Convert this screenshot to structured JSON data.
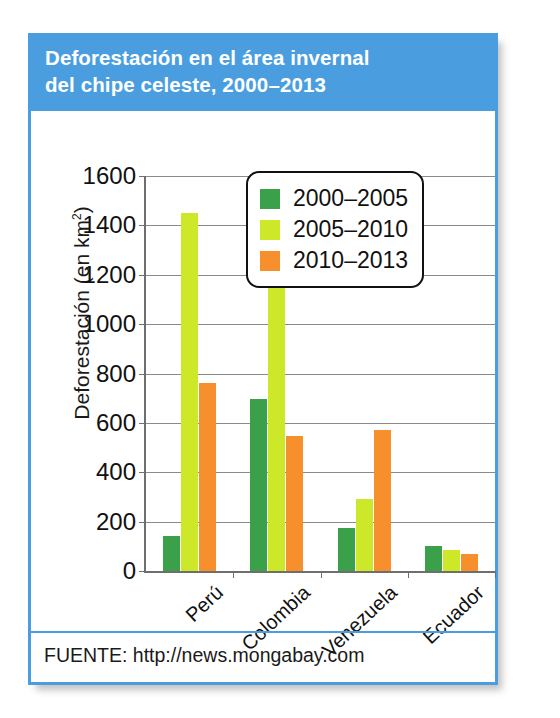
{
  "card": {
    "title_line1": "Deforestación en el área invernal",
    "title_line2": "del chipe celeste, 2000–2013",
    "source": "FUENTE: http://news.mongabay.com",
    "header_color": "#4a9ee0",
    "frame_color": "#4a9ee0"
  },
  "chart_data": {
    "type": "bar",
    "title": "Deforestación en el área invernal del chipe celeste, 2000–2013",
    "xlabel": "",
    "ylabel": "Deforestación (en km²)",
    "ylabel_plain": "Deforestación (en km",
    "ylabel_exponent": "2",
    "ylabel_close": ")",
    "categories": [
      "Perú",
      "Colombia",
      "Venezuela",
      "Ecuador"
    ],
    "series": [
      {
        "name": "2000–2005",
        "color": "#3aa04a",
        "values": [
          140,
          695,
          175,
          100
        ]
      },
      {
        "name": "2005–2010",
        "color": "#cde829",
        "values": [
          1450,
          1230,
          290,
          85
        ]
      },
      {
        "name": "2010–2013",
        "color": "#f7902c",
        "values": [
          760,
          545,
          570,
          68
        ]
      }
    ],
    "ylim": [
      0,
      1600
    ],
    "ytick_labels": [
      "1600",
      "1400",
      "1200",
      "1000",
      "800",
      "600",
      "400",
      "200",
      "0"
    ],
    "ytick_values": [
      1600,
      1400,
      1200,
      1000,
      800,
      600,
      400,
      200,
      0
    ],
    "ytick_step": 200,
    "grid": true,
    "legend_position": "upper-right-inset",
    "legend_entries": [
      "2000–2005",
      "2005–2010",
      "2010–2013"
    ]
  }
}
